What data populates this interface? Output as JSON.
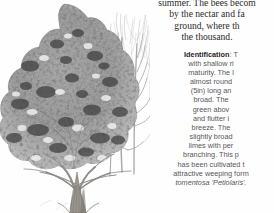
{
  "page": {
    "background_color": "#ffffff",
    "layout": "two-column: illustration left, body text right (text clipped at right page edge)"
  },
  "illustration": {
    "caption_absent": true,
    "subject": "broad-crowned deciduous lime (linden) tree in full leaf, with a bare winter tree and fine twigs behind",
    "style": "monochrome pencil / halftone engraving",
    "ink_color": "#6b6b6b",
    "shadow_color": "#3a3a3a",
    "trunk_color": "#8a8782",
    "elements": [
      "foliage-crown",
      "trunk",
      "bare-branch-tree",
      "background-twigs"
    ]
  },
  "body_text": {
    "serif_paragraph": {
      "clipped_right": true,
      "lines": [
        "summer. The bees becom",
        "by the nectar and fa",
        "ground, where th",
        "the thousand."
      ]
    },
    "identification_section": {
      "heading": "Identification",
      "heading_separator": ":",
      "clipped_right": true,
      "lines": [
        {
          "text": "T",
          "heading": true
        },
        {
          "text": "with shallow ri"
        },
        {
          "text": "maturity. The l"
        },
        {
          "text": "almost round"
        },
        {
          "text": "(5in) long an"
        },
        {
          "text": "broad. The"
        },
        {
          "text": "green abov"
        },
        {
          "text": "and flutter i"
        },
        {
          "text": "breeze. The"
        },
        {
          "text": "slightly broad"
        },
        {
          "text": "limes with per"
        },
        {
          "text": "branching. This p"
        },
        {
          "text": "has been cultivated t"
        },
        {
          "text": "attractive weeping form"
        },
        {
          "text": "tomentosa 'Petiolaris'.",
          "italic": true
        }
      ]
    }
  }
}
